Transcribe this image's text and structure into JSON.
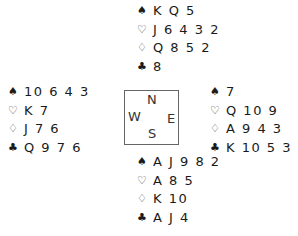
{
  "suit_symbols": {
    "spades": "♠",
    "hearts": "♡",
    "diamonds": "♢",
    "clubs": "♣"
  },
  "hands": {
    "north": {
      "spades": "K Q 5",
      "hearts": "J 6 4 3 2",
      "diamonds": "Q 8 5 2",
      "clubs": "8"
    },
    "west": {
      "spades": "10 6 4 3",
      "hearts": "K 7",
      "diamonds": "J 7 6",
      "clubs": "Q 9 7 6"
    },
    "east": {
      "spades": "7",
      "hearts": "Q 10 9",
      "diamonds": "A 9 4 3",
      "clubs": "K 10 5 3 2"
    },
    "south": {
      "spades": "A J 9 8 2",
      "hearts": "A 8 5",
      "diamonds": "K 10",
      "clubs": "A J 4"
    }
  },
  "compass": {
    "n": "N",
    "s": "S",
    "w": "W",
    "e": "E"
  }
}
